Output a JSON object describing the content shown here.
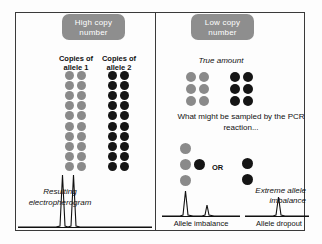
{
  "figure": {
    "panels": {
      "left": {
        "badge": "High copy number",
        "header_allele1": "Copies of allele 1",
        "header_allele2": "Copies of allele 2",
        "grid_allele1": {
          "rows": 10,
          "cols": 2,
          "count": 20,
          "color": "#8a8a8a"
        },
        "grid_allele2": {
          "rows": 10,
          "cols": 2,
          "count": 20,
          "color": "#151515"
        },
        "electropherogram_caption": "Resulting electropherogram"
      },
      "right": {
        "badge": "Low copy number",
        "true_amount_caption": "True amount",
        "grid_true_allele1": {
          "rows": 3,
          "cols": 2,
          "count": 6,
          "color": "#8a8a8a"
        },
        "grid_true_allele2": {
          "rows": 3,
          "cols": 2,
          "count": 6,
          "color": "#151515"
        },
        "sampled_caption": "What might be sampled by the PCR reaction...",
        "or_label": "OR",
        "sampled_left": {
          "gray": 3,
          "black": 1
        },
        "sampled_right": {
          "gray": 0,
          "black": 2
        },
        "extreme_caption": "Extreme allele imbalance",
        "label_imbalance": "Allele imbalance",
        "label_dropout": "Allele dropout"
      }
    },
    "colors": {
      "badge_bg": "#8e8e8e",
      "badge_text": "#ffffff",
      "allele1_dot": "#8a8a8a",
      "allele2_dot": "#151515",
      "frame_border": "#3a3a3a",
      "background": "#fdfdfd"
    }
  },
  "chart_data": [
    {
      "type": "line",
      "name": "resulting-electropherogram",
      "title": "Resulting electropherogram",
      "xlabel": "",
      "ylabel": "",
      "peaks": [
        {
          "label": "allele 1",
          "x": 46,
          "height": 100
        },
        {
          "label": "allele 2",
          "x": 57,
          "height": 100
        }
      ],
      "ylim": [
        0,
        110
      ],
      "grid": false,
      "legend": "none"
    },
    {
      "type": "line",
      "name": "allele-imbalance-trace",
      "title": "Allele imbalance",
      "xlabel": "",
      "ylabel": "",
      "peaks": [
        {
          "label": "allele 1",
          "x": 30,
          "height": 100
        },
        {
          "label": "allele 2",
          "x": 58,
          "height": 38
        }
      ],
      "ylim": [
        0,
        110
      ],
      "grid": false,
      "legend": "none"
    },
    {
      "type": "line",
      "name": "allele-dropout-trace",
      "title": "Allele dropout",
      "xlabel": "",
      "ylabel": "",
      "peaks": [
        {
          "label": "allele 2",
          "x": 55,
          "height": 62
        }
      ],
      "ylim": [
        0,
        110
      ],
      "grid": false,
      "legend": "none"
    }
  ]
}
